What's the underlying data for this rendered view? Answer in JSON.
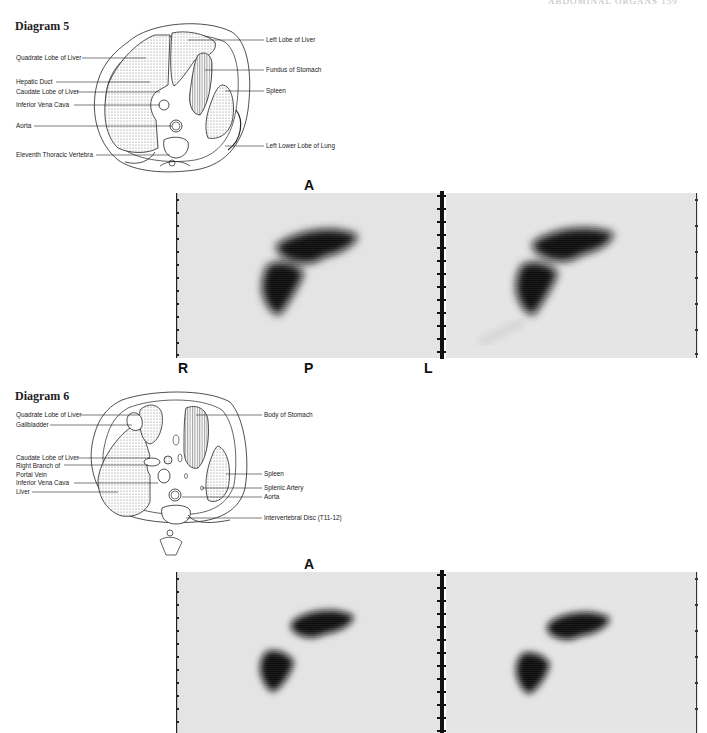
{
  "page": {
    "header_fragment": "ABDOMINAL ORGANS    159",
    "colors": {
      "background": "#ffffff",
      "scan_bg": "#e2e2e2",
      "uptake": "#0d0d0d",
      "stipple": "#9a9a9a"
    }
  },
  "diagram5": {
    "title": "Diagram 5",
    "labels_left": [
      "Quadrate Lobe of Liver",
      "Hepatic Duct",
      "Caudate Lobe of Liver",
      "Inferior Vena Cava",
      "Aorta",
      "Eleventh Thoracic Vertebra"
    ],
    "labels_right": [
      "Left Lobe of Liver",
      "Fundus of Stomach",
      "Spleen",
      "Left Lower Lobe of Lung"
    ]
  },
  "scan5": {
    "top_label": "A",
    "bottom_labels": [
      "R",
      "P",
      "L"
    ]
  },
  "diagram6": {
    "title": "Diagram 6",
    "labels_left": [
      "Quadrate Lobe of Liver",
      "Gallbladder",
      "Caudate Lobe of Liver",
      "Right Branch of",
      "Portal Vein",
      "Inferior Vena Cava",
      "Liver"
    ],
    "labels_right": [
      "Body of Stomach",
      "Spleen",
      "Splenic Artery",
      "Aorta",
      "Intervertebral Disc (T11-12)"
    ]
  },
  "scan6": {
    "top_label": "A"
  }
}
